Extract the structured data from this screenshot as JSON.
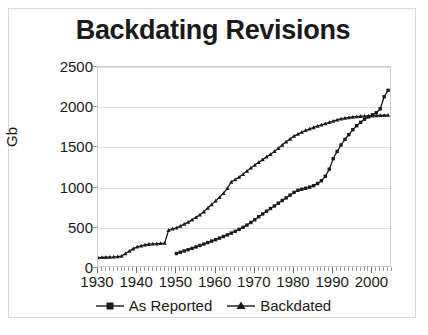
{
  "chart_data": {
    "type": "line",
    "title": "Backdating Revisions",
    "xlabel": "",
    "ylabel": "Gb",
    "xlim": [
      1930,
      2005
    ],
    "ylim": [
      0,
      2500
    ],
    "grid": true,
    "legend_position": "bottom",
    "x_ticks": [
      1930,
      1940,
      1950,
      1960,
      1970,
      1980,
      1990,
      2000
    ],
    "y_ticks": [
      0,
      500,
      1000,
      1500,
      2000,
      2500
    ],
    "x_minor_tick_interval": 1,
    "series": [
      {
        "name": "As Reported",
        "marker": "square",
        "color": "#1a1a1a",
        "x": [
          1950,
          1951,
          1952,
          1953,
          1954,
          1955,
          1956,
          1957,
          1958,
          1959,
          1960,
          1961,
          1962,
          1963,
          1964,
          1965,
          1966,
          1967,
          1968,
          1969,
          1970,
          1971,
          1972,
          1973,
          1974,
          1975,
          1976,
          1977,
          1978,
          1979,
          1980,
          1981,
          1982,
          1983,
          1984,
          1985,
          1986,
          1987,
          1988,
          1989,
          1990,
          1991,
          1992,
          1993,
          1994,
          1995,
          1996,
          1997,
          1998,
          1999,
          2000,
          2001,
          2002,
          2003,
          2004
        ],
        "values": [
          180,
          196,
          212,
          228,
          244,
          262,
          280,
          298,
          316,
          334,
          352,
          372,
          392,
          412,
          434,
          456,
          480,
          506,
          534,
          566,
          600,
          638,
          672,
          706,
          740,
          772,
          806,
          840,
          872,
          906,
          940,
          966,
          980,
          992,
          1006,
          1024,
          1050,
          1086,
          1140,
          1230,
          1360,
          1450,
          1530,
          1600,
          1660,
          1720,
          1770,
          1812,
          1850,
          1880,
          1906,
          1932,
          1980,
          2130,
          2210
        ]
      },
      {
        "name": "Backdated",
        "marker": "triangle",
        "color": "#1a1a1a",
        "x": [
          1930,
          1931,
          1932,
          1933,
          1934,
          1935,
          1936,
          1937,
          1938,
          1939,
          1940,
          1941,
          1942,
          1943,
          1944,
          1945,
          1946,
          1947,
          1948,
          1949,
          1950,
          1951,
          1952,
          1953,
          1954,
          1955,
          1956,
          1957,
          1958,
          1959,
          1960,
          1961,
          1962,
          1963,
          1964,
          1965,
          1966,
          1967,
          1968,
          1969,
          1970,
          1971,
          1972,
          1973,
          1974,
          1975,
          1976,
          1977,
          1978,
          1979,
          1980,
          1981,
          1982,
          1983,
          1984,
          1985,
          1986,
          1987,
          1988,
          1989,
          1990,
          1991,
          1992,
          1993,
          1994,
          1995,
          1996,
          1997,
          1998,
          1999,
          2000,
          2001,
          2002,
          2003,
          2004
        ],
        "values": [
          130,
          132,
          134,
          136,
          138,
          142,
          148,
          180,
          210,
          240,
          262,
          276,
          288,
          296,
          300,
          302,
          306,
          310,
          470,
          486,
          500,
          520,
          545,
          570,
          600,
          630,
          662,
          700,
          745,
          790,
          835,
          880,
          930,
          990,
          1070,
          1100,
          1130,
          1165,
          1205,
          1245,
          1280,
          1315,
          1348,
          1382,
          1415,
          1450,
          1490,
          1530,
          1570,
          1605,
          1640,
          1665,
          1690,
          1712,
          1730,
          1748,
          1764,
          1780,
          1796,
          1812,
          1828,
          1842,
          1854,
          1864,
          1872,
          1878,
          1884,
          1888,
          1890,
          1892,
          1894,
          1896,
          1898,
          1900,
          1902
        ]
      }
    ]
  },
  "legend": {
    "items": [
      {
        "label": "As Reported",
        "marker": "square"
      },
      {
        "label": "Backdated",
        "marker": "triangle"
      }
    ]
  },
  "caption": {
    "text": ""
  }
}
